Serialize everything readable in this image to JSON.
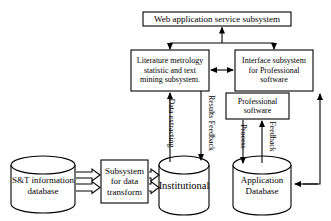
{
  "diagram": {
    "colors": {
      "stroke": "#000000",
      "fill": "#ffffff",
      "text": "#000000"
    },
    "nodes": {
      "web_app": {
        "label": "Web application service subsystem",
        "shape": "rectangle"
      },
      "literature": {
        "label": "Literature metrology\nstatistic and text\nmining subsystem.",
        "shape": "rectangle"
      },
      "interface": {
        "label": "Interface subsystem\nfor Professional\nsoftware",
        "shape": "rectangle"
      },
      "professional": {
        "label": "Professional\nsoftware",
        "shape": "rectangle"
      },
      "st_info_db": {
        "label": "S&T information\ndatabase",
        "shape": "cylinder"
      },
      "transform": {
        "label": "Subsystem\nfor data\ntransform",
        "shape": "rectangle"
      },
      "institutional": {
        "label": "Institutional",
        "shape": "cylinder"
      },
      "application_db": {
        "label": "Application\nDatabase",
        "shape": "cylinder"
      }
    },
    "edge_labels": {
      "data_extracting": "Data\nextracting",
      "results_feedback": "Results\nFeedback",
      "process": "Process",
      "feedback": "Feedback"
    },
    "edges": [
      {
        "from": "literature",
        "to": "web_app",
        "type": "arrow-up"
      },
      {
        "from": "interface",
        "to": "web_app",
        "type": "arrow-up"
      },
      {
        "from": "web_app",
        "to": "literature",
        "type": "arrow-down"
      },
      {
        "from": "web_app",
        "to": "interface",
        "type": "arrow-down"
      },
      {
        "from": "literature",
        "to": "interface",
        "type": "bidirectional"
      },
      {
        "from": "institutional",
        "to": "literature",
        "type": "arrow-up",
        "label": "Data extracting"
      },
      {
        "from": "literature",
        "to": "institutional",
        "type": "arrow-down",
        "label": "Results Feedback"
      },
      {
        "from": "professional",
        "to": "application_db",
        "type": "arrow-down",
        "label": "Process"
      },
      {
        "from": "application_db",
        "to": "professional",
        "type": "arrow-up",
        "label": "Feedback"
      },
      {
        "from": "application_db",
        "to": "interface",
        "type": "arrow-up"
      },
      {
        "from": "interface",
        "to": "application_db",
        "type": "arrow-left"
      },
      {
        "from": "st_info_db",
        "to": "transform",
        "type": "block-arrow"
      },
      {
        "from": "transform",
        "to": "institutional",
        "type": "block-arrow"
      }
    ]
  }
}
